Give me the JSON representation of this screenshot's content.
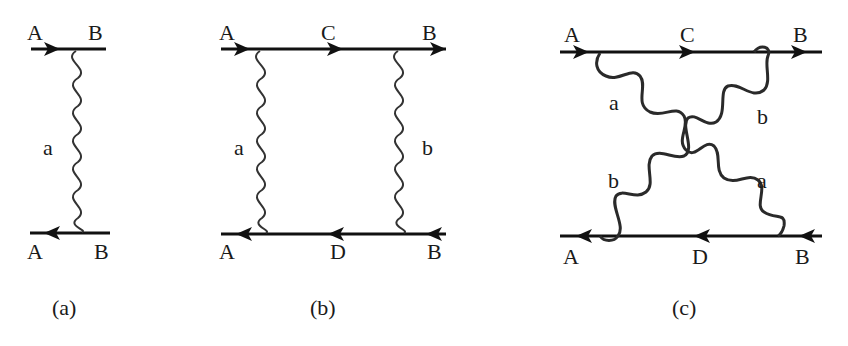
{
  "diagrams": [
    {
      "id": "a",
      "caption": "(a)",
      "top_labels": [
        "A",
        "B"
      ],
      "bottom_labels": [
        "A",
        "B"
      ],
      "exchange_labels": [
        "a"
      ]
    },
    {
      "id": "b",
      "caption": "(b)",
      "top_labels": [
        "A",
        "C",
        "B"
      ],
      "bottom_labels": [
        "A",
        "D",
        "B"
      ],
      "exchange_labels": [
        "a",
        "b"
      ]
    },
    {
      "id": "c",
      "caption": "(c)",
      "top_labels": [
        "A",
        "C",
        "B"
      ],
      "bottom_labels": [
        "A",
        "D",
        "B"
      ],
      "exchange_labels": [
        "a",
        "b",
        "b",
        "a"
      ]
    }
  ],
  "colors": {
    "line": "#111111",
    "wave": "#333333",
    "text": "#1a1a1a",
    "background": "#ffffff"
  }
}
